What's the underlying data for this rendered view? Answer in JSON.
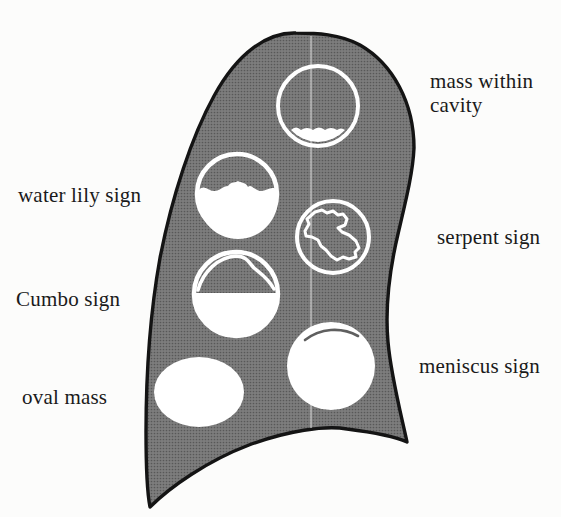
{
  "labels": {
    "mass_within_cavity": "mass within cavity",
    "water_lily": "water lily sign",
    "serpent": "serpent sign",
    "cumbo": "Cumbo sign",
    "meniscus": "meniscus sign",
    "oval_mass": "oval mass"
  },
  "colors": {
    "background": "#fcfcfb",
    "lung_base": "#7d7d7d",
    "lung_dot": "#585858",
    "outline": "#141414",
    "cyst_white": "#ffffff",
    "crescent": "#5f5f5f",
    "fold_line": "#d6d6d6",
    "text": "#1a1a1a"
  }
}
